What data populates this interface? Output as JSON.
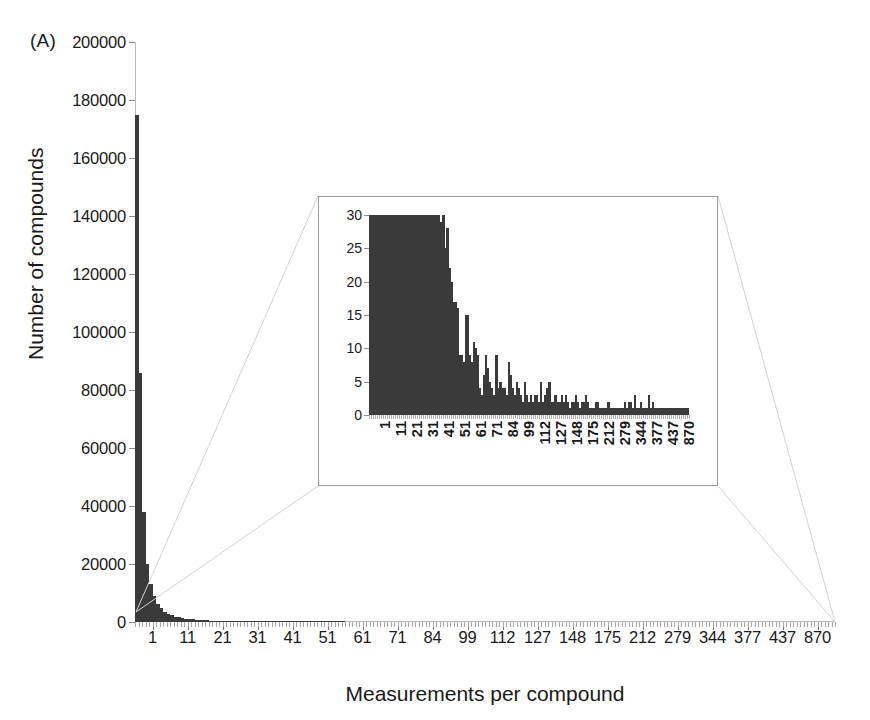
{
  "figure": {
    "panel_label": "(A)"
  },
  "chart_data": [
    {
      "id": "main",
      "type": "bar",
      "title": "",
      "xlabel": "Measurements per compound",
      "ylabel": "Number of compounds",
      "ylim": [
        0,
        200000
      ],
      "ytick_step": 20000,
      "ytick_labels": [
        "0",
        "20000",
        "40000",
        "60000",
        "80000",
        "100000",
        "120000",
        "140000",
        "160000",
        "180000",
        "200000"
      ],
      "ytick_values": [
        0,
        20000,
        40000,
        60000,
        80000,
        100000,
        120000,
        140000,
        160000,
        180000,
        200000
      ],
      "xtick_labels": [
        "1",
        "11",
        "21",
        "31",
        "41",
        "51",
        "61",
        "71",
        "84",
        "99",
        "112",
        "127",
        "148",
        "175",
        "212",
        "279",
        "344",
        "377",
        "437",
        "870"
      ],
      "grid": false,
      "legend": "none",
      "bar_color": "#3a3a3a",
      "note": "Number of compounds binned by number of measurements; strongly right-skewed decay.",
      "categories": [
        1,
        2,
        3,
        4,
        5,
        6,
        7,
        8,
        9,
        10,
        11,
        12,
        13,
        14,
        15,
        16,
        17,
        18,
        19,
        20,
        21,
        22,
        23,
        24,
        25,
        26,
        27,
        28,
        29,
        30,
        31,
        32,
        33,
        34,
        35,
        36,
        37,
        38,
        39,
        40,
        41,
        42,
        43,
        44,
        45,
        46,
        47,
        48,
        49,
        50,
        51,
        52,
        53,
        54,
        55,
        56,
        57,
        58,
        59,
        60
      ],
      "values": [
        175000,
        86000,
        38000,
        20000,
        13000,
        8800,
        6300,
        4700,
        3600,
        2900,
        2300,
        1900,
        1600,
        1350,
        1150,
        1000,
        880,
        780,
        690,
        620,
        560,
        500,
        460,
        420,
        380,
        350,
        320,
        300,
        280,
        260,
        240,
        225,
        210,
        196,
        184,
        172,
        162,
        152,
        144,
        136,
        128,
        121,
        115,
        109,
        104,
        99,
        94,
        90,
        86,
        82,
        78,
        75,
        72,
        69,
        66,
        64,
        61,
        59,
        57,
        55
      ]
    },
    {
      "id": "inset",
      "type": "bar",
      "title": "",
      "xlabel": "",
      "ylabel": "",
      "ylim": [
        0,
        30
      ],
      "ytick_step": 5,
      "ytick_labels": [
        "0",
        "5",
        "10",
        "15",
        "20",
        "25",
        "30"
      ],
      "ytick_values": [
        0,
        5,
        10,
        15,
        20,
        25,
        30
      ],
      "xtick_labels": [
        "1",
        "11",
        "21",
        "31",
        "41",
        "51",
        "61",
        "71",
        "84",
        "99",
        "112",
        "127",
        "148",
        "175",
        "212",
        "279",
        "344",
        "377",
        "437",
        "870"
      ],
      "grid": false,
      "legend": "none",
      "bar_color": "#3a3a3a",
      "note": "Magnified view of the tail: counts clipped at 30 for the first ~35 bins, then sparse spiky decay to 1.",
      "values": [
        30,
        30,
        30,
        30,
        30,
        30,
        30,
        30,
        30,
        30,
        30,
        30,
        30,
        30,
        30,
        30,
        30,
        30,
        30,
        30,
        30,
        30,
        30,
        30,
        30,
        30,
        30,
        30,
        30,
        30,
        30,
        30,
        30,
        30,
        30,
        29,
        30,
        25,
        28,
        22,
        20,
        17,
        17,
        16,
        9,
        9,
        8,
        15,
        15,
        9,
        8,
        11,
        10,
        9,
        4,
        3,
        6,
        9,
        7,
        5,
        4,
        3,
        9,
        4,
        5,
        4,
        4,
        3,
        8,
        6,
        4,
        3,
        5,
        4,
        3,
        2,
        5,
        3,
        2,
        3,
        2,
        3,
        3,
        2,
        5,
        2,
        3,
        4,
        5,
        2,
        2,
        3,
        2,
        2,
        3,
        2,
        3,
        2,
        1,
        2,
        2,
        3,
        2,
        1,
        2,
        2,
        3,
        2,
        1,
        1,
        1,
        2,
        2,
        1,
        1,
        1,
        1,
        2,
        1,
        1,
        1,
        1,
        1,
        1,
        1,
        2,
        1,
        2,
        2,
        1,
        3,
        1,
        1,
        2,
        1,
        1,
        1,
        3,
        1,
        2,
        1,
        1,
        1,
        1,
        1,
        1,
        1,
        1,
        1,
        1,
        1,
        1,
        1,
        1,
        1,
        1,
        1
      ]
    }
  ]
}
